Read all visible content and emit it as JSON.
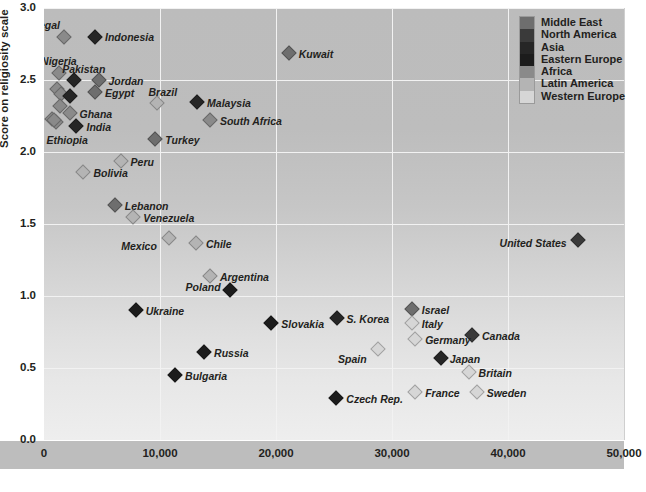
{
  "chart_data": {
    "type": "scatter",
    "title": "",
    "xlabel": "",
    "ylabel": "Score on religiosity scale",
    "xlim": [
      0,
      50000
    ],
    "ylim": [
      0,
      3.0
    ],
    "xticks": [
      "0",
      "10,000",
      "20,000",
      "30,000",
      "40,000",
      "50,000"
    ],
    "xtick_values": [
      0,
      10000,
      20000,
      30000,
      40000,
      50000
    ],
    "yticks": [
      "0.0",
      "0.5",
      "1.0",
      "1.5",
      "2.0",
      "2.5",
      "3.0"
    ],
    "ytick_values": [
      0.0,
      0.5,
      1.0,
      1.5,
      2.0,
      2.5,
      3.0
    ],
    "grid": true,
    "legend_position": "top-right",
    "series": [
      {
        "name": "Middle East",
        "color": "#6e6e6e"
      },
      {
        "name": "North America",
        "color": "#3a3a3a"
      },
      {
        "name": "Asia",
        "color": "#262626"
      },
      {
        "name": "Eastern Europe",
        "color": "#1c1c1c"
      },
      {
        "name": "Africa",
        "color": "#8a8a8a"
      },
      {
        "name": "Latin America",
        "color": "#b4b4b4"
      },
      {
        "name": "Western Europe",
        "color": "#d6d6d6"
      }
    ],
    "points": [
      {
        "label": "Senegal",
        "group": "Africa",
        "x": 1700,
        "y": 2.8,
        "lx": -44,
        "ly": -17
      },
      {
        "label": "Indonesia",
        "group": "Asia",
        "x": 4400,
        "y": 2.8,
        "lx": 10,
        "ly": -5
      },
      {
        "label": "Nigeria",
        "group": "Africa",
        "x": 1300,
        "y": 2.55,
        "lx": -18,
        "ly": -17
      },
      {
        "label": "Pakistan",
        "group": "Asia",
        "x": 2600,
        "y": 2.5,
        "lx": -12,
        "ly": -16
      },
      {
        "label": "Jordan",
        "group": "Middle East",
        "x": 4700,
        "y": 2.5,
        "lx": 10,
        "ly": -4
      },
      {
        "label": "Egypt",
        "group": "Middle East",
        "x": 4400,
        "y": 2.42,
        "lx": 10,
        "ly": -4
      },
      {
        "label": "Brazil",
        "group": "Latin America",
        "x": 9700,
        "y": 2.34,
        "lx": -8,
        "ly": -16
      },
      {
        "label": "Malaysia",
        "group": "Asia",
        "x": 13200,
        "y": 2.35,
        "lx": 10,
        "ly": -4
      },
      {
        "label": "South Africa",
        "group": "Africa",
        "x": 14300,
        "y": 2.22,
        "lx": 10,
        "ly": -4
      },
      {
        "label": "Ghana",
        "group": "Africa",
        "x": 2200,
        "y": 2.27,
        "lx": 10,
        "ly": -4
      },
      {
        "label": "India",
        "group": "Asia",
        "x": 2800,
        "y": 2.18,
        "lx": 10,
        "ly": -4
      },
      {
        "label": "Ethiopia",
        "group": "Africa",
        "x": 900,
        "y": 2.22,
        "lx": -8,
        "ly": 15
      },
      {
        "label": "Kuwait",
        "group": "Middle East",
        "x": 21100,
        "y": 2.69,
        "lx": 10,
        "ly": -4
      },
      {
        "label": "Turkey",
        "group": "Middle East",
        "x": 9600,
        "y": 2.09,
        "lx": 10,
        "ly": -4
      },
      {
        "label": "Peru",
        "group": "Latin America",
        "x": 6600,
        "y": 1.94,
        "lx": 10,
        "ly": -4
      },
      {
        "label": "Bolivia",
        "group": "Latin America",
        "x": 3400,
        "y": 1.86,
        "lx": 10,
        "ly": -4
      },
      {
        "label": "Lebanon",
        "group": "Middle East",
        "x": 6100,
        "y": 1.63,
        "lx": 10,
        "ly": -4
      },
      {
        "label": "Venezuela",
        "group": "Latin America",
        "x": 7700,
        "y": 1.55,
        "lx": 10,
        "ly": -4
      },
      {
        "label": "Mexico",
        "group": "Latin America",
        "x": 10800,
        "y": 1.4,
        "lx": -48,
        "ly": 3
      },
      {
        "label": "Chile",
        "group": "Latin America",
        "x": 13100,
        "y": 1.37,
        "lx": 10,
        "ly": -4
      },
      {
        "label": "United States",
        "group": "North America",
        "x": 46000,
        "y": 1.39,
        "lx": -78,
        "ly": -2
      },
      {
        "label": "Argentina",
        "group": "Latin America",
        "x": 14300,
        "y": 1.14,
        "lx": 10,
        "ly": -4
      },
      {
        "label": "Poland",
        "group": "Eastern Europe",
        "x": 16000,
        "y": 1.04,
        "lx": -44,
        "ly": -8
      },
      {
        "label": "Ukraine",
        "group": "Eastern Europe",
        "x": 7900,
        "y": 0.9,
        "lx": 10,
        "ly": -4
      },
      {
        "label": "Slovakia",
        "group": "Eastern Europe",
        "x": 19600,
        "y": 0.81,
        "lx": 10,
        "ly": -4
      },
      {
        "label": "S. Korea",
        "group": "Asia",
        "x": 25300,
        "y": 0.85,
        "lx": 9,
        "ly": -4
      },
      {
        "label": "Israel",
        "group": "Middle East",
        "x": 31700,
        "y": 0.91,
        "lx": 10,
        "ly": -4
      },
      {
        "label": "Italy",
        "group": "Western Europe",
        "x": 31700,
        "y": 0.81,
        "lx": 10,
        "ly": -4
      },
      {
        "label": "Canada",
        "group": "North America",
        "x": 36900,
        "y": 0.73,
        "lx": 10,
        "ly": -4
      },
      {
        "label": "Germany",
        "group": "Western Europe",
        "x": 32000,
        "y": 0.7,
        "lx": 10,
        "ly": -4
      },
      {
        "label": "Spain",
        "group": "Western Europe",
        "x": 28800,
        "y": 0.63,
        "lx": -40,
        "ly": 5
      },
      {
        "label": "Russia",
        "group": "Eastern Europe",
        "x": 13800,
        "y": 0.61,
        "lx": 10,
        "ly": -4
      },
      {
        "label": "Japan",
        "group": "Asia",
        "x": 34200,
        "y": 0.57,
        "lx": 9,
        "ly": -4
      },
      {
        "label": "Britain",
        "group": "Western Europe",
        "x": 36600,
        "y": 0.47,
        "lx": 10,
        "ly": -4
      },
      {
        "label": "Bulgaria",
        "group": "Eastern Europe",
        "x": 11300,
        "y": 0.45,
        "lx": 10,
        "ly": -4
      },
      {
        "label": "France",
        "group": "Western Europe",
        "x": 32000,
        "y": 0.33,
        "lx": 10,
        "ly": -4
      },
      {
        "label": "Sweden",
        "group": "Western Europe",
        "x": 37300,
        "y": 0.33,
        "lx": 10,
        "ly": -4
      },
      {
        "label": "Czech Rep.",
        "group": "Eastern Europe",
        "x": 25200,
        "y": 0.29,
        "lx": 10,
        "ly": -4
      }
    ],
    "unlabeled_points": [
      {
        "group": "Africa",
        "x": 1150,
        "y": 2.44
      },
      {
        "group": "Africa",
        "x": 1450,
        "y": 2.4
      },
      {
        "group": "Asia",
        "x": 2200,
        "y": 2.39
      },
      {
        "group": "Africa",
        "x": 1350,
        "y": 2.32
      },
      {
        "group": "Africa",
        "x": 700,
        "y": 2.23
      },
      {
        "group": "Africa",
        "x": 1050,
        "y": 2.21
      }
    ]
  }
}
